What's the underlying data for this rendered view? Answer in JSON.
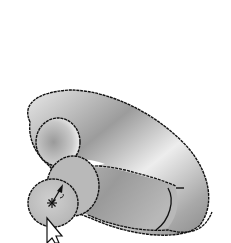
{
  "viewport": {
    "background": "#ffffff",
    "width": 231,
    "height": 243
  },
  "model": {
    "name": "curved-tube",
    "outline_color": "#111111",
    "shade_light": "#f2f2f2",
    "shade_mid": "#bdbdbd",
    "shade_dark": "#8a8a8a",
    "end_face_color": "#c4c4c4"
  },
  "markers": {
    "center_marker": "asterisk",
    "direction_arrow": "arrow"
  },
  "cursor": {
    "icon": "arrow-pointer-icon",
    "x": 47,
    "y": 218
  }
}
